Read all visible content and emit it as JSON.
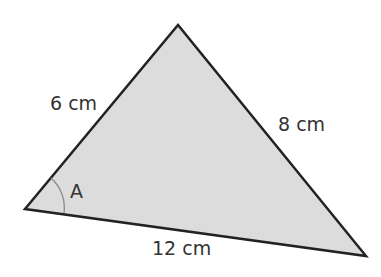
{
  "diagram": {
    "type": "triangle",
    "fill": "#dcdcdc",
    "stroke": "#222222",
    "vertices": {
      "left": [
        25,
        209
      ],
      "top": [
        178,
        25
      ],
      "right": [
        366,
        256
      ]
    },
    "sides": {
      "left_top": "6 cm",
      "top_right": "8 cm",
      "left_right": "12 cm"
    },
    "angle_label": "A"
  }
}
